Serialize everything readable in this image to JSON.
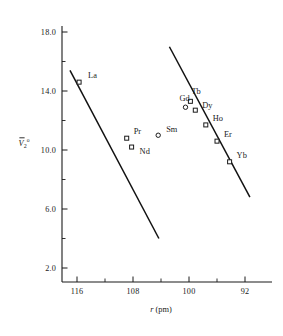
{
  "chart_data": {
    "type": "scatter",
    "title": "",
    "xlabel": "r (pm)",
    "ylabel": "V̅2°",
    "ylabel_parts": {
      "base": "V",
      "sub": "2",
      "sup": "o"
    },
    "xlim": [
      118.5,
      90.0
    ],
    "ylim": [
      0.8,
      19.2
    ],
    "x_inverted": true,
    "grid": false,
    "legend": "none",
    "xticks": [
      116,
      108,
      100,
      92
    ],
    "xticklabels": [
      "116",
      "108",
      "100",
      "92"
    ],
    "xticks_minor": [
      112,
      104,
      96
    ],
    "yticks": [
      18.0,
      14.0,
      10.0,
      6.0,
      2.0
    ],
    "yticklabels": [
      "18.0",
      "14.0",
      "10.0",
      "6.0",
      "2.0"
    ],
    "yticks_minor": [
      16.0,
      12.0,
      8.0,
      4.0
    ],
    "points": [
      {
        "label": "La",
        "x": 115.7,
        "y": 14.6,
        "marker": "open-square",
        "on_line": "upper-left",
        "label_dx": 9,
        "label_dy": -4
      },
      {
        "label": "Pr",
        "x": 108.9,
        "y": 10.8,
        "marker": "open-square",
        "on_line": "upper-left",
        "label_dx": 7,
        "label_dy": -4
      },
      {
        "label": "Nd",
        "x": 108.2,
        "y": 10.2,
        "marker": "open-square",
        "on_line": "upper-left",
        "label_dx": 8,
        "label_dy": 7
      },
      {
        "label": "Sm",
        "x": 104.4,
        "y": 11.0,
        "marker": "open-circle",
        "on_line": "none",
        "label_dx": 8,
        "label_dy": -3
      },
      {
        "label": "Gd",
        "x": 100.5,
        "y": 12.9,
        "marker": "open-circle",
        "on_line": "none",
        "label_dx": -6,
        "label_dy": -6
      },
      {
        "label": "Tb",
        "x": 99.8,
        "y": 13.3,
        "marker": "open-square",
        "on_line": "lower-right",
        "label_dx": 1,
        "label_dy": -7
      },
      {
        "label": "Dy",
        "x": 99.1,
        "y": 12.7,
        "marker": "open-square",
        "on_line": "lower-right",
        "label_dx": 7,
        "label_dy": -2
      },
      {
        "label": "Ho",
        "x": 97.6,
        "y": 11.7,
        "marker": "open-square",
        "on_line": "lower-right",
        "label_dx": 7,
        "label_dy": -4
      },
      {
        "label": "Er",
        "x": 96.0,
        "y": 10.6,
        "marker": "open-square",
        "on_line": "lower-right",
        "label_dx": 7,
        "label_dy": -4
      },
      {
        "label": "Yb",
        "x": 94.2,
        "y": 9.2,
        "marker": "open-square",
        "on_line": "lower-right",
        "label_dx": 7,
        "label_dy": -4
      }
    ],
    "lines": [
      {
        "name": "upper-left-series-fit",
        "x1": 117.0,
        "y1": 15.4,
        "x2": 104.3,
        "y2": 4.0
      },
      {
        "name": "lower-right-series-fit",
        "x1": 102.8,
        "y1": 17.0,
        "x2": 91.3,
        "y2": 6.8
      }
    ],
    "marker_size_square": 4.0,
    "marker_size_circle": 3.2,
    "axis_color": "#1a1a1a",
    "line_color": "#111111"
  }
}
